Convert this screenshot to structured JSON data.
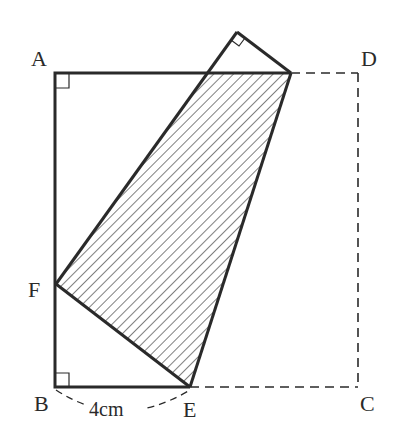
{
  "figure": {
    "type": "folded-rectangle-geometry",
    "points": {
      "A": {
        "label": "A",
        "x": 55,
        "y": 73
      },
      "B": {
        "label": "B",
        "x": 55,
        "y": 387
      },
      "C": {
        "label": "C",
        "x": 358,
        "y": 387
      },
      "D": {
        "label": "D",
        "x": 358,
        "y": 73
      },
      "E": {
        "label": "E",
        "x": 190,
        "y": 387
      },
      "F": {
        "label": "F",
        "x": 56,
        "y": 284
      }
    },
    "folded_apex": {
      "x": 237,
      "y": 32
    },
    "fold_top": {
      "x": 291,
      "y": 73
    },
    "measurement": {
      "label": "4cm",
      "between": "B-E"
    },
    "right_angle_marks": [
      "A",
      "B",
      "folded-apex"
    ],
    "colors": {
      "stroke": "#2a2a2a",
      "hatch": "#3a3a3a",
      "background": "#ffffff"
    }
  },
  "labels": {
    "A": "A",
    "B": "B",
    "C": "C",
    "D": "D",
    "E": "E",
    "F": "F",
    "measure": "4cm"
  }
}
